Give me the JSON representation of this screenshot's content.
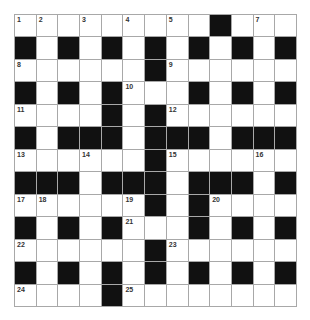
{
  "puzzle": {
    "rows": 13,
    "cols": 13,
    "pattern": [
      "WWWWWWWWWBWWW",
      "BWBWBWBWBWBWB",
      "WWWWWWBWWWWWW",
      "BWBWBWWWBWBWB",
      "WWWWBWBWWWWWW",
      "BWBBBWBBBWBBB",
      "WWWWWWBWWWWWW",
      "BBBWBBBWBBBWB",
      "WWWWWWBWBWWWW",
      "BWBWBWWWBWBWB",
      "WWWWWWBWWWWWW",
      "BWBWBWBWBWBWB",
      "WWWWBWWWWWWWW"
    ],
    "numbers": [
      {
        "r": 0,
        "c": 0,
        "n": "1"
      },
      {
        "r": 0,
        "c": 1,
        "n": "2"
      },
      {
        "r": 0,
        "c": 3,
        "n": "3"
      },
      {
        "r": 0,
        "c": 5,
        "n": "4"
      },
      {
        "r": 0,
        "c": 7,
        "n": "5"
      },
      {
        "r": 0,
        "c": 9,
        "n": "6"
      },
      {
        "r": 0,
        "c": 11,
        "n": "7"
      },
      {
        "r": 2,
        "c": 0,
        "n": "8"
      },
      {
        "r": 2,
        "c": 7,
        "n": "9"
      },
      {
        "r": 3,
        "c": 5,
        "n": "10"
      },
      {
        "r": 4,
        "c": 0,
        "n": "11"
      },
      {
        "r": 4,
        "c": 7,
        "n": "12"
      },
      {
        "r": 6,
        "c": 0,
        "n": "13"
      },
      {
        "r": 6,
        "c": 3,
        "n": "14"
      },
      {
        "r": 6,
        "c": 7,
        "n": "15"
      },
      {
        "r": 6,
        "c": 11,
        "n": "16"
      },
      {
        "r": 8,
        "c": 0,
        "n": "17"
      },
      {
        "r": 8,
        "c": 1,
        "n": "18"
      },
      {
        "r": 8,
        "c": 5,
        "n": "19"
      },
      {
        "r": 8,
        "c": 9,
        "n": "20"
      },
      {
        "r": 9,
        "c": 5,
        "n": "21"
      },
      {
        "r": 10,
        "c": 0,
        "n": "22"
      },
      {
        "r": 10,
        "c": 7,
        "n": "23"
      },
      {
        "r": 12,
        "c": 0,
        "n": "24"
      },
      {
        "r": 12,
        "c": 5,
        "n": "25"
      }
    ],
    "colors": {
      "black_square": "#111111",
      "white_square": "#ffffff",
      "grid_line": "#a8a8a8",
      "number_text": "#333333"
    }
  }
}
